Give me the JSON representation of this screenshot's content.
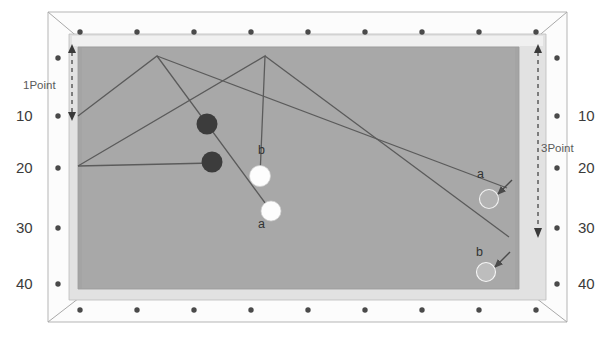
{
  "diagram": {
    "table": {
      "felt_color": "#a8a8a8",
      "rail_color": "#d6d6d6",
      "frame_color": "#fbfbfb",
      "outline_color": "#9a9a9a",
      "pocket_dot_color": "#4a4a4a",
      "cushion_top_color": "#e9e9e9"
    },
    "left_axis": {
      "ticks": [
        "10",
        "20",
        "30",
        "40"
      ],
      "point_label": "1Point"
    },
    "right_axis": {
      "ticks": [
        "10",
        "20",
        "30",
        "40"
      ],
      "point_label": "3Point"
    },
    "balls": [
      {
        "id": "cue1",
        "kind": "dark",
        "label": "",
        "cx": 207,
        "cy": 124,
        "r": 10.5,
        "fill": "#3c3c3c"
      },
      {
        "id": "cue2",
        "kind": "dark",
        "label": "",
        "cx": 212,
        "cy": 162,
        "r": 10.5,
        "fill": "#3c3c3c"
      },
      {
        "id": "objb-left",
        "kind": "white",
        "label": "b",
        "cx": 260,
        "cy": 176,
        "r": 10.5,
        "fill": "#fdfdfd"
      },
      {
        "id": "obja-left",
        "kind": "white",
        "label": "a",
        "cx": 271,
        "cy": 211,
        "r": 10.0,
        "fill": "#fdfdfd"
      },
      {
        "id": "obja-right",
        "kind": "target",
        "label": "a",
        "cx": 489,
        "cy": 199,
        "r": 9.5,
        "fill": "#b3b3b3"
      },
      {
        "id": "objb-right",
        "kind": "target",
        "label": "b",
        "cx": 486,
        "cy": 272,
        "r": 9.5,
        "fill": "#bdbdbd"
      }
    ],
    "ball_labels": [
      {
        "text": "b",
        "x": 262,
        "y": 150
      },
      {
        "text": "a",
        "x": 261,
        "y": 219
      },
      {
        "text": "a",
        "x": 479,
        "y": 170
      },
      {
        "text": "b",
        "x": 479,
        "y": 248
      }
    ],
    "shot_paths": [
      {
        "name": "path-a",
        "points": "78,116 157,56 271,211"
      },
      {
        "name": "path-b",
        "points": "78,166 265,56 260,176"
      },
      {
        "name": "path-long-a",
        "points": "157,56 505,188"
      },
      {
        "name": "path-long-b",
        "points": "265,56 507,236"
      }
    ],
    "arrows": [
      {
        "name": "arrow-to-a",
        "from": [
          507,
          182
        ],
        "to": [
          497,
          194
        ]
      },
      {
        "name": "arrow-to-b",
        "from": [
          508,
          253
        ],
        "to": [
          494,
          268
        ]
      }
    ],
    "measures": [
      {
        "name": "left-measure",
        "label": "1Point",
        "x": 72,
        "y_top": 50,
        "y_bottom": 118
      },
      {
        "name": "right-measure",
        "label": "3Point",
        "x": 538,
        "y_top": 50,
        "y_bottom": 236
      }
    ]
  }
}
